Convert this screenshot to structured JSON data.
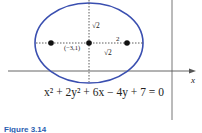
{
  "figure": {
    "caption": "Figure 3.14",
    "equation": "x² + 2y² + 6x − 4y + 7 = 0",
    "axis_label_x": "x",
    "center_label": "(−3,1)",
    "minor_axis_label": "√2",
    "focal_label": "√2",
    "semi_major_label": "2",
    "colors": {
      "ellipse": "#3a4fb0",
      "axes": "#555555",
      "caption": "#2a5db0"
    }
  }
}
